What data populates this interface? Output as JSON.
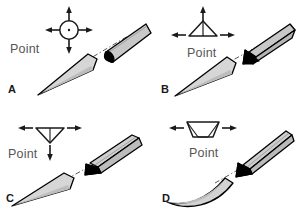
{
  "figure": {
    "background_color": "#ffffff",
    "panel_count": 4,
    "colors": {
      "outline": "#000000",
      "facet_black": "#000000",
      "blade_light_gray": "#d4d4d4",
      "shaft_gray": "#c8c8c8",
      "text_gray": "#565656",
      "label_black": "#1a1a1a",
      "axis_line": "#333333"
    }
  },
  "panels": [
    {
      "id": "a",
      "label": "A",
      "point_label": "Point",
      "symbol": {
        "name": "circle-with-center-dot",
        "shape": "circle",
        "has_center_dot": true,
        "arrows": [
          "up",
          "down",
          "left",
          "right"
        ],
        "arrow_count": 4
      },
      "needle": {
        "facet": "oval-bevel",
        "tip": "straight-taper",
        "shaft": "straight"
      }
    },
    {
      "id": "b",
      "label": "B",
      "point_label": "Point",
      "symbol": {
        "name": "upright-triangle",
        "shape": "triangle-up",
        "has_center_dot": false,
        "arrows": [
          "up",
          "left",
          "right"
        ],
        "arrow_count": 3
      },
      "needle": {
        "facet": "triangular-bevel-top",
        "tip": "straight-taper",
        "shaft": "straight"
      }
    },
    {
      "id": "c",
      "label": "C",
      "point_label": "Point",
      "symbol": {
        "name": "inverted-triangle",
        "shape": "triangle-down",
        "has_center_dot": false,
        "arrows": [
          "down",
          "left",
          "right"
        ],
        "arrow_count": 3
      },
      "needle": {
        "facet": "triangular-bevel-bottom",
        "tip": "straight-taper",
        "shaft": "straight-ridged"
      }
    },
    {
      "id": "d",
      "label": "D",
      "point_label": "Point",
      "symbol": {
        "name": "trapezoid-bowl",
        "shape": "trapezoid",
        "has_center_dot": false,
        "arrows": [
          "left",
          "right"
        ],
        "arrow_count": 2
      },
      "needle": {
        "facet": "wedge-bevel",
        "tip": "curved-taper",
        "shaft": "curved"
      }
    }
  ]
}
